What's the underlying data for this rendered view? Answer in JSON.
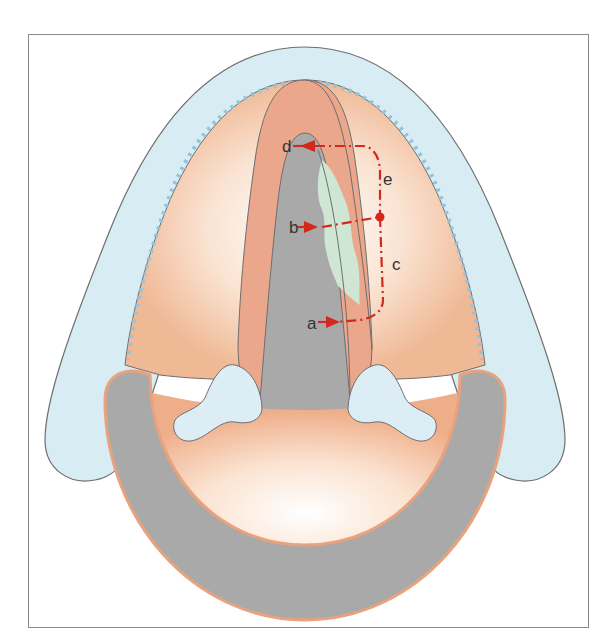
{
  "figure": {
    "type": "anatomical-diagram",
    "labels": [
      {
        "id": "a",
        "text": "a"
      },
      {
        "id": "b",
        "text": "b"
      },
      {
        "id": "c",
        "text": "c"
      },
      {
        "id": "d",
        "text": "d"
      },
      {
        "id": "e",
        "text": "e"
      }
    ],
    "colors": {
      "frame": "#8a8a8a",
      "epiglottis": "#d8ecf3",
      "outline": "#6e6e6e",
      "dotted_line": "#8fc3e0",
      "mucosa_light": "#f6d7c0",
      "vocal_fold": "#eba78b",
      "airway": "#a9a9a9",
      "lesion": "#cfe6d5",
      "arytenoid": "#dcedf5",
      "annotation": "#d3281e"
    }
  }
}
